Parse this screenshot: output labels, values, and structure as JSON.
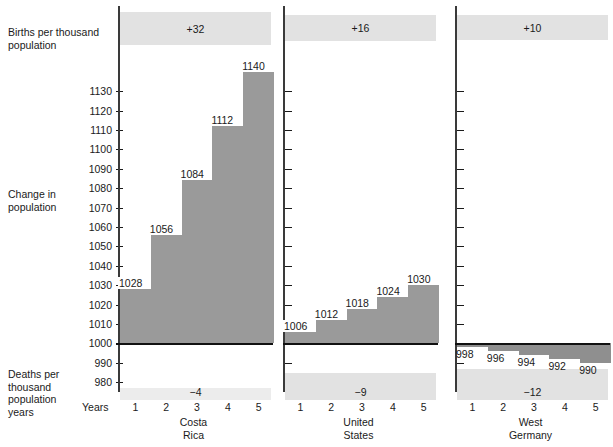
{
  "row_labels": {
    "births": "Births per thousand\npopulation",
    "change": "Change in\npopulation",
    "deaths": "Deaths per\nthousand\npopulation\nyears",
    "years": "Years"
  },
  "y_axis": {
    "ticks": [
      1130,
      1120,
      1110,
      1100,
      1090,
      1080,
      1070,
      1060,
      1050,
      1040,
      1030,
      1020,
      1010,
      1000,
      990,
      980
    ],
    "min": 975,
    "max": 1145,
    "zero_reference": 1000
  },
  "x_axis": {
    "tick_labels": [
      "1",
      "2",
      "3",
      "4",
      "5"
    ]
  },
  "colors": {
    "bar": "#9a9a9a",
    "band": "#e2e2e2",
    "band_light": "#ececec",
    "zero_line": "#111111",
    "axis": "#3a3a3a"
  },
  "chart_data": {
    "type": "bar",
    "title": "",
    "xlabel": "Years",
    "ylabel": "Change in population",
    "ylim": [
      975,
      1145
    ],
    "grid": false,
    "legend": "none",
    "categories": [
      "1",
      "2",
      "3",
      "4",
      "5"
    ],
    "panels": [
      {
        "country": "Costa\nRica",
        "births_per_thousand": "+32",
        "deaths_per_thousand": "−4",
        "values": [
          1028,
          1056,
          1084,
          1112,
          1140
        ],
        "labels": [
          "1028",
          "1056",
          "1084",
          "1112",
          "1140"
        ]
      },
      {
        "country": "United\nStates",
        "births_per_thousand": "+16",
        "deaths_per_thousand": "−9",
        "values": [
          1006,
          1012,
          1018,
          1024,
          1030
        ],
        "labels": [
          "1006",
          "1012",
          "1018",
          "1024",
          "1030"
        ]
      },
      {
        "country": "West\nGermany",
        "births_per_thousand": "+10",
        "deaths_per_thousand": "−12",
        "values": [
          998,
          996,
          994,
          992,
          990
        ],
        "labels": [
          "998",
          "996",
          "994",
          "992",
          "990"
        ]
      }
    ]
  }
}
